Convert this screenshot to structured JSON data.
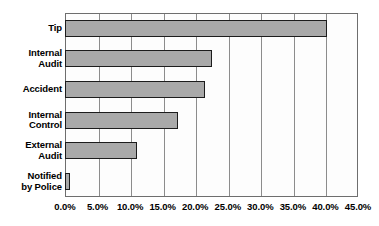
{
  "chart_data": {
    "type": "bar",
    "orientation": "horizontal",
    "title": "",
    "subtitle": "",
    "xlabel": "",
    "ylabel": "",
    "categories": [
      "Tip",
      "Internal Audit",
      "Accident",
      "Internal Control",
      "External Audit",
      "Notified by Police"
    ],
    "values": [
      40.2,
      22.6,
      21.5,
      17.4,
      11.1,
      0.7
    ],
    "series": [
      {
        "name": "Initial Detection Method",
        "values": [
          40.2,
          22.6,
          21.5,
          17.4,
          11.1,
          0.7
        ]
      }
    ],
    "xlim": [
      0,
      45
    ],
    "xticks": [
      0,
      5,
      10,
      15,
      20,
      25,
      30,
      35,
      40,
      45
    ],
    "xtick_labels": [
      "0.0%",
      "5.0%",
      "10.0%",
      "15.0%",
      "20.0%",
      "25.0%",
      "30.0%",
      "35.0%",
      "40.0%",
      "45.0%"
    ],
    "grid": true,
    "grid_axis": "x",
    "legend": false,
    "legend_position": "none",
    "bar_fill_color": "#a9a9a9",
    "bar_border_color": "#1c1c1c",
    "plot_border_color": "#6e6e6e",
    "gridline_color": "#8c8c8c",
    "background_color": "#ffffff"
  },
  "categories_display": [
    {
      "lines": [
        "Tip"
      ]
    },
    {
      "lines": [
        "Internal",
        "Audit"
      ]
    },
    {
      "lines": [
        "Accident"
      ]
    },
    {
      "lines": [
        "Internal",
        "Control"
      ]
    },
    {
      "lines": [
        "External",
        "Audit"
      ]
    },
    {
      "lines": [
        "Notified",
        "by Police"
      ]
    }
  ]
}
